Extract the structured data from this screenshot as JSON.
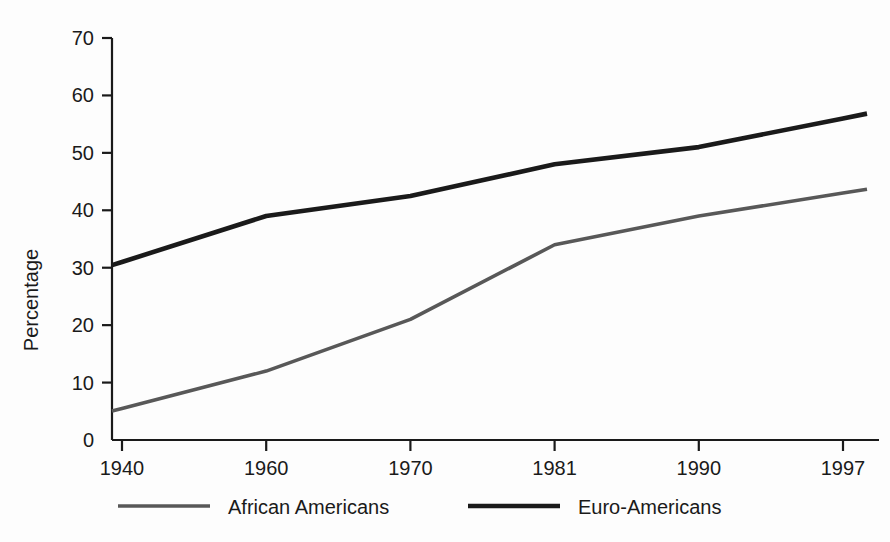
{
  "chart_data": {
    "type": "line",
    "title": "",
    "subtitle": "",
    "xlabel": "",
    "ylabel": "Percentage",
    "categories": [
      "1940",
      "1960",
      "1970",
      "1981",
      "1990",
      "1997"
    ],
    "x_tick_labels": [
      "1940",
      "1960",
      "1970",
      "1981",
      "1990",
      "1997"
    ],
    "y_tick_labels": [
      "0",
      "10",
      "20",
      "30",
      "40",
      "50",
      "60",
      "70"
    ],
    "y_ticks": [
      0,
      10,
      20,
      30,
      40,
      50,
      60,
      70
    ],
    "ylim": [
      0,
      70
    ],
    "grid": false,
    "legend_position": "bottom",
    "series": [
      {
        "name": "African Americans",
        "color": "#585858",
        "line_width": 3.6,
        "values": [
          5.5,
          12,
          21,
          34,
          39,
          43
        ]
      },
      {
        "name": "Euro-Americans",
        "color": "#1a1a1a",
        "line_width": 4.6,
        "values": [
          31,
          39,
          42.5,
          48,
          51,
          56
        ]
      }
    ]
  },
  "legend": {
    "items": [
      {
        "label": "African Americans",
        "color": "#585858"
      },
      {
        "label": "Euro-Americans",
        "color": "#1a1a1a"
      }
    ]
  },
  "axes": {
    "y_axis_title": "Percentage"
  }
}
